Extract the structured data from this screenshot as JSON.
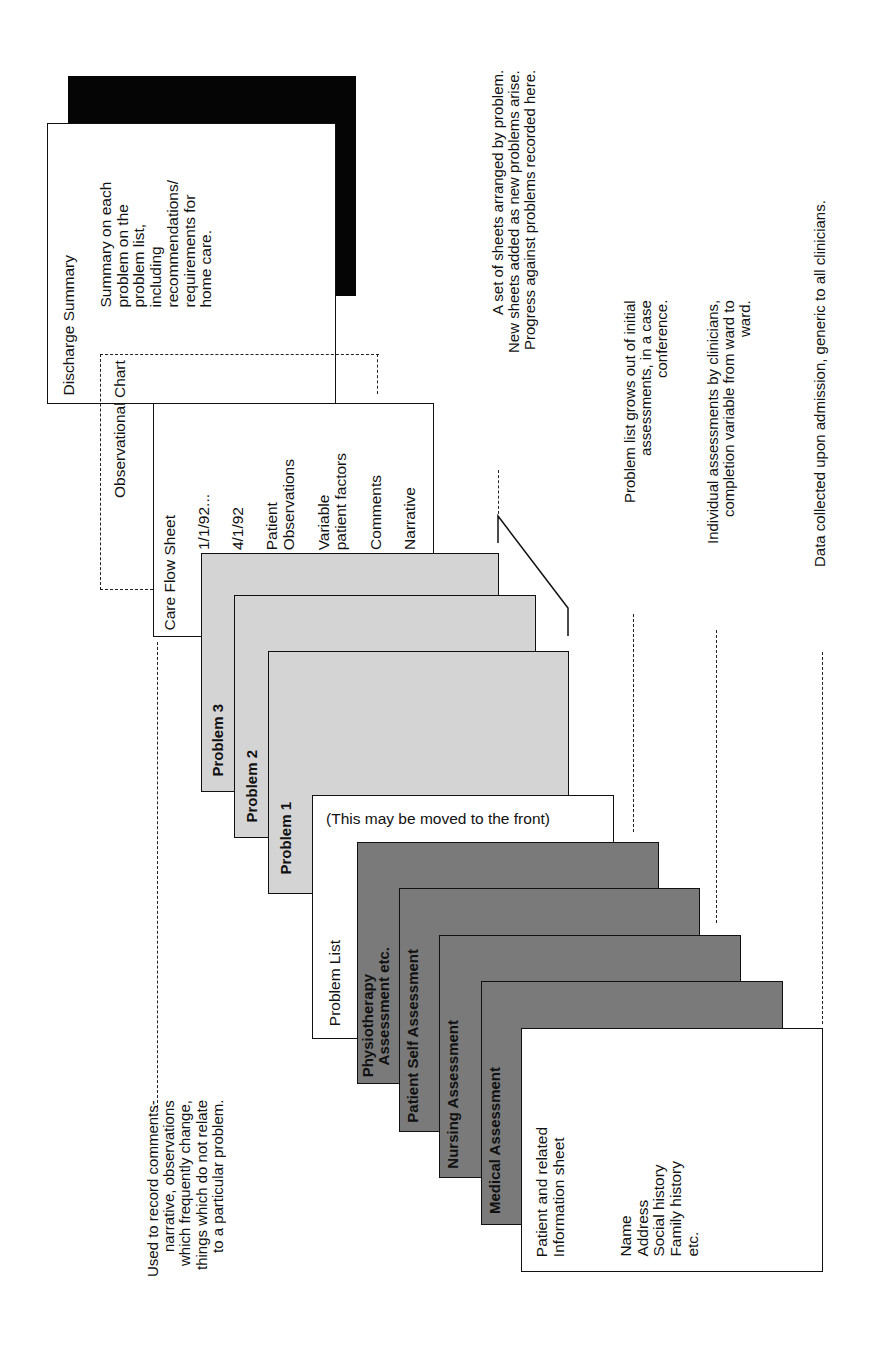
{
  "discharge": {
    "title": "Discharge Summary",
    "body": "Summary on each\nproblem on the\nproblem list,\nincluding\nrecommendations/\nrequirements for\nhome care."
  },
  "observational_chart": {
    "title": "Observational Chart"
  },
  "care_flow_sheet": {
    "title": "Care Flow Sheet",
    "columns": [
      "1/1/92...",
      "4/1/92",
      "Patient\nObservations",
      "Variable\npatient factors",
      "Comments",
      "Narrative"
    ]
  },
  "problems": [
    {
      "label": "Problem 3"
    },
    {
      "label": "Problem 2"
    },
    {
      "label": "Problem 1"
    }
  ],
  "problem_list": {
    "title": "Problem List",
    "note": "(This may be moved to the front)"
  },
  "assessments": [
    {
      "label": "Physiotherapy\n   Assessment etc."
    },
    {
      "label": "Patient Self Assessment"
    },
    {
      "label": "Nursing Assessment"
    },
    {
      "label": "Medical Assessment"
    }
  ],
  "patient_info": {
    "title": "Patient and related\nInformation sheet",
    "fields": "Name\nAddress\nSocial history\nFamily history\netc."
  },
  "annotations": {
    "care_flow": "Used to record comments-\nnarrative, observations\nwhich frequently change,\nthings which do not relate\nto a particular problem.",
    "problems": "A set of sheets arranged by problem.\nNew sheets added as new problems arise.\nProgress against problems recorded here.",
    "problem_list": "Problem list grows out of initial\nassessments, in a case\nconference.",
    "assessments": "Individual assessments by clinicians,\ncompletion variable from ward to\nward.",
    "patient_info": "Data collected upon admission, generic to all clinicians."
  }
}
